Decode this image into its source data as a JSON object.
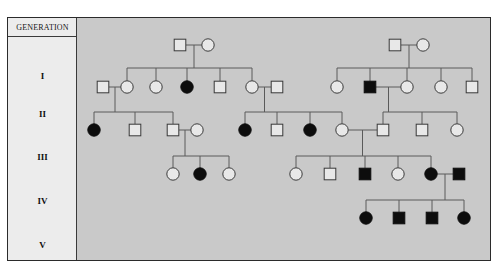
{
  "figure": {
    "type": "pedigree-chart",
    "background_color": "#c9c9c9",
    "label_column_color": "#ececec",
    "line_color": "#5a5a5a",
    "affected_color": "#0d0d0d",
    "unaffected_color": "#e8e8e8",
    "header_label": "GENERATION",
    "generation_labels": [
      {
        "label": "I",
        "y": 58
      },
      {
        "label": "II",
        "y": 96
      },
      {
        "label": "III",
        "y": 139
      },
      {
        "label": "IV",
        "y": 183
      },
      {
        "label": "V",
        "y": 227
      }
    ],
    "legend": {
      "square_meaning": "male",
      "circle_meaning": "female",
      "filled_meaning": "affected",
      "open_meaning": "unaffected"
    },
    "generation_rows_y": {
      "I": 27,
      "II": 69,
      "III": 112,
      "IV": 156,
      "V": 200
    },
    "symbols": [
      {
        "id": "I-1",
        "gen": "I",
        "shape": "square",
        "status": "unaffected",
        "x": 103,
        "y": 27
      },
      {
        "id": "I-2",
        "gen": "I",
        "shape": "circle",
        "status": "unaffected",
        "x": 131,
        "y": 27
      },
      {
        "id": "I-3",
        "gen": "I",
        "shape": "square",
        "status": "unaffected",
        "x": 318,
        "y": 27
      },
      {
        "id": "I-4",
        "gen": "I",
        "shape": "circle",
        "status": "unaffected",
        "x": 346,
        "y": 27
      },
      {
        "id": "II-1",
        "gen": "II",
        "shape": "square",
        "status": "unaffected",
        "x": 26,
        "y": 69
      },
      {
        "id": "II-2",
        "gen": "II",
        "shape": "circle",
        "status": "unaffected",
        "x": 50,
        "y": 69
      },
      {
        "id": "II-3",
        "gen": "II",
        "shape": "circle",
        "status": "unaffected",
        "x": 79,
        "y": 69
      },
      {
        "id": "II-4",
        "gen": "II",
        "shape": "circle",
        "status": "affected",
        "x": 110,
        "y": 69
      },
      {
        "id": "II-5",
        "gen": "II",
        "shape": "square",
        "status": "unaffected",
        "x": 143,
        "y": 69
      },
      {
        "id": "II-6",
        "gen": "II",
        "shape": "circle",
        "status": "unaffected",
        "x": 175,
        "y": 69
      },
      {
        "id": "II-7",
        "gen": "II",
        "shape": "square",
        "status": "unaffected",
        "x": 200,
        "y": 69
      },
      {
        "id": "II-8",
        "gen": "II",
        "shape": "circle",
        "status": "unaffected",
        "x": 260,
        "y": 69
      },
      {
        "id": "II-9",
        "gen": "II",
        "shape": "square",
        "status": "affected",
        "x": 293,
        "y": 69
      },
      {
        "id": "II-10",
        "gen": "II",
        "shape": "circle",
        "status": "unaffected",
        "x": 330,
        "y": 69
      },
      {
        "id": "II-11",
        "gen": "II",
        "shape": "circle",
        "status": "unaffected",
        "x": 364,
        "y": 69
      },
      {
        "id": "II-12",
        "gen": "II",
        "shape": "square",
        "status": "unaffected",
        "x": 395,
        "y": 69
      },
      {
        "id": "III-1",
        "gen": "III",
        "shape": "circle",
        "status": "affected",
        "x": 17,
        "y": 112
      },
      {
        "id": "III-2",
        "gen": "III",
        "shape": "square",
        "status": "unaffected",
        "x": 58,
        "y": 112
      },
      {
        "id": "III-3",
        "gen": "III",
        "shape": "square",
        "status": "unaffected",
        "x": 96,
        "y": 112
      },
      {
        "id": "III-4",
        "gen": "III",
        "shape": "circle",
        "status": "unaffected",
        "x": 120,
        "y": 112
      },
      {
        "id": "III-5",
        "gen": "III",
        "shape": "circle",
        "status": "affected",
        "x": 168,
        "y": 112
      },
      {
        "id": "III-6",
        "gen": "III",
        "shape": "square",
        "status": "unaffected",
        "x": 200,
        "y": 112
      },
      {
        "id": "III-7",
        "gen": "III",
        "shape": "circle",
        "status": "affected",
        "x": 233,
        "y": 112
      },
      {
        "id": "III-8",
        "gen": "III",
        "shape": "circle",
        "status": "unaffected",
        "x": 265,
        "y": 112
      },
      {
        "id": "III-9",
        "gen": "III",
        "shape": "square",
        "status": "unaffected",
        "x": 306,
        "y": 112
      },
      {
        "id": "III-10",
        "gen": "III",
        "shape": "square",
        "status": "unaffected",
        "x": 345,
        "y": 112
      },
      {
        "id": "III-11",
        "gen": "III",
        "shape": "circle",
        "status": "unaffected",
        "x": 380,
        "y": 112
      },
      {
        "id": "IV-1",
        "gen": "IV",
        "shape": "circle",
        "status": "unaffected",
        "x": 96,
        "y": 156
      },
      {
        "id": "IV-2",
        "gen": "IV",
        "shape": "circle",
        "status": "affected",
        "x": 123,
        "y": 156
      },
      {
        "id": "IV-3",
        "gen": "IV",
        "shape": "circle",
        "status": "unaffected",
        "x": 152,
        "y": 156
      },
      {
        "id": "IV-4",
        "gen": "IV",
        "shape": "circle",
        "status": "unaffected",
        "x": 219,
        "y": 156
      },
      {
        "id": "IV-5",
        "gen": "IV",
        "shape": "square",
        "status": "unaffected",
        "x": 253,
        "y": 156
      },
      {
        "id": "IV-6",
        "gen": "IV",
        "shape": "square",
        "status": "affected",
        "x": 288,
        "y": 156
      },
      {
        "id": "IV-7",
        "gen": "IV",
        "shape": "circle",
        "status": "unaffected",
        "x": 321,
        "y": 156
      },
      {
        "id": "IV-8",
        "gen": "IV",
        "shape": "circle",
        "status": "affected",
        "x": 354,
        "y": 156
      },
      {
        "id": "IV-9",
        "gen": "IV",
        "shape": "square",
        "status": "affected",
        "x": 382,
        "y": 156
      },
      {
        "id": "V-1",
        "gen": "V",
        "shape": "circle",
        "status": "affected",
        "x": 289,
        "y": 200
      },
      {
        "id": "V-2",
        "gen": "V",
        "shape": "square",
        "status": "affected",
        "x": 322,
        "y": 200
      },
      {
        "id": "V-3",
        "gen": "V",
        "shape": "square",
        "status": "affected",
        "x": 355,
        "y": 200
      },
      {
        "id": "V-4",
        "gen": "V",
        "shape": "circle",
        "status": "affected",
        "x": 387,
        "y": 200
      }
    ],
    "counts": {
      "total_individuals": 40,
      "affected_individuals": 13,
      "generations": 5
    }
  }
}
